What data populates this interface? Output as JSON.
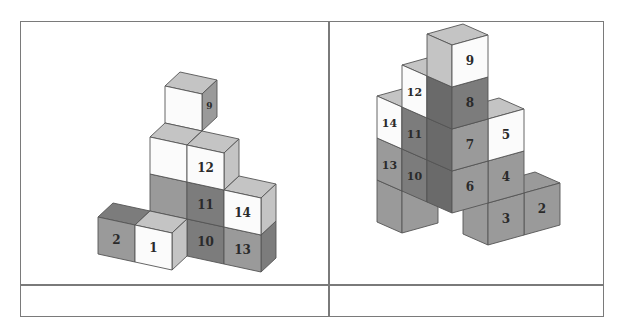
{
  "layout": {
    "columns": 2,
    "rows": 2,
    "cells": [
      {
        "id": "top-left",
        "content": "figure-left"
      },
      {
        "id": "top-right",
        "content": "figure-right"
      },
      {
        "id": "bottom-left",
        "content": ""
      },
      {
        "id": "bottom-right",
        "content": ""
      }
    ]
  },
  "colors": {
    "white": "#fbfbfb",
    "light": "#c4c4c4",
    "mid": "#9a9a9a",
    "dark": "#7c7c7c",
    "darker": "#6a6a6a",
    "edge": "#555555",
    "border": "#7a7a7a"
  },
  "figures": [
    {
      "name": "left-cube-stack",
      "origin": [
        135,
        262
      ],
      "axisX": [
        37,
        8
      ],
      "axisY": [
        15,
        -14
      ],
      "axisZ": [
        0,
        -37
      ],
      "faces": [
        "front",
        "right",
        "top"
      ],
      "cubes": [
        {
          "x": 0,
          "y": 2,
          "z": 3,
          "front": "white",
          "right": "mid",
          "top": "light",
          "frontLabel": "",
          "rightLabel": "9"
        },
        {
          "x": 0,
          "y": 1,
          "z": 2,
          "front": "white",
          "right": "mid",
          "top": "light",
          "frontLabel": "",
          "rightLabel": "5"
        },
        {
          "x": 0,
          "y": 1,
          "z": 1,
          "front": "mid",
          "right": "dark",
          "top": "light",
          "frontLabel": "",
          "rightLabel": "4"
        },
        {
          "x": 1,
          "y": 1,
          "z": 2,
          "front": "white",
          "right": "light",
          "top": "light",
          "frontLabel": "12",
          "rightLabel": ""
        },
        {
          "x": 1,
          "y": 1,
          "z": 1,
          "front": "dark",
          "right": "dark",
          "top": "light",
          "frontLabel": "11",
          "rightLabel": ""
        },
        {
          "x": 1,
          "y": 1,
          "z": 0,
          "front": "dark",
          "right": "dark",
          "top": "dark",
          "frontLabel": "10",
          "rightLabel": ""
        },
        {
          "x": 0,
          "y": 1,
          "z": 0,
          "front": "dark",
          "right": "darker",
          "top": "dark",
          "frontLabel": "",
          "rightLabel": "3"
        },
        {
          "x": 2,
          "y": 1,
          "z": 1,
          "front": "white",
          "right": "light",
          "top": "light",
          "frontLabel": "14",
          "rightLabel": ""
        },
        {
          "x": 2,
          "y": 1,
          "z": 0,
          "front": "mid",
          "right": "dark",
          "top": "light",
          "frontLabel": "13",
          "rightLabel": ""
        },
        {
          "x": -1,
          "y": 0,
          "z": 0,
          "front": "mid",
          "right": "mid",
          "top": "dark",
          "frontLabel": "2",
          "rightLabel": ""
        },
        {
          "x": 0,
          "y": 0,
          "z": 0,
          "front": "white",
          "right": "light",
          "top": "light",
          "frontLabel": "1",
          "rightLabel": ""
        }
      ]
    },
    {
      "name": "right-cube-stack",
      "origin": [
        452,
        255
      ],
      "axisR": [
        36,
        -10
      ],
      "axisL": [
        -25,
        -11
      ],
      "axisZ": [
        0,
        -42
      ],
      "faces": [
        "left",
        "right",
        "top"
      ],
      "cubes": [
        {
          "r": 2,
          "l": 1,
          "z": 0,
          "left": "mid",
          "right": "mid",
          "top": "mid",
          "rightLabel": "2",
          "leftLabel": ""
        },
        {
          "r": 1,
          "l": 2,
          "z": 1,
          "left": "mid",
          "right": "mid",
          "top": "light",
          "rightLabel": "",
          "leftLabel": ""
        },
        {
          "r": 1,
          "l": 1,
          "z": 2,
          "left": "mid",
          "right": "white",
          "top": "light",
          "rightLabel": "5",
          "leftLabel": ""
        },
        {
          "r": 0,
          "l": 3,
          "z": 2,
          "left": "white",
          "right": "mid",
          "top": "light",
          "rightLabel": "",
          "leftLabel": "14"
        },
        {
          "r": 0,
          "l": 3,
          "z": 1,
          "left": "mid",
          "right": "mid",
          "top": "light",
          "rightLabel": "",
          "leftLabel": "13"
        },
        {
          "r": 0,
          "l": 3,
          "z": 0,
          "left": "mid",
          "right": "mid",
          "top": "mid",
          "rightLabel": "",
          "leftLabel": ""
        },
        {
          "r": 0,
          "l": 2,
          "z": 3,
          "left": "white",
          "right": "mid",
          "top": "light",
          "rightLabel": "",
          "leftLabel": "12"
        },
        {
          "r": 0,
          "l": 2,
          "z": 2,
          "left": "dark",
          "right": "mid",
          "top": "light",
          "rightLabel": "",
          "leftLabel": "11"
        },
        {
          "r": 0,
          "l": 2,
          "z": 1,
          "left": "dark",
          "right": "mid",
          "top": "mid",
          "rightLabel": "",
          "leftLabel": "10"
        },
        {
          "r": 1,
          "l": 1,
          "z": 1,
          "left": "mid",
          "right": "mid",
          "top": "mid",
          "rightLabel": "4",
          "leftLabel": ""
        },
        {
          "r": 1,
          "l": 1,
          "z": 0,
          "left": "mid",
          "right": "mid",
          "top": "mid",
          "rightLabel": "3",
          "leftLabel": ""
        },
        {
          "r": 0,
          "l": 1,
          "z": 4,
          "left": "light",
          "right": "white",
          "top": "light",
          "rightLabel": "9",
          "leftLabel": ""
        },
        {
          "r": 0,
          "l": 1,
          "z": 3,
          "left": "darker",
          "right": "dark",
          "top": "mid",
          "rightLabel": "8",
          "leftLabel": ""
        },
        {
          "r": 0,
          "l": 1,
          "z": 2,
          "left": "darker",
          "right": "mid",
          "top": "mid",
          "rightLabel": "7",
          "leftLabel": ""
        },
        {
          "r": 0,
          "l": 1,
          "z": 1,
          "left": "darker",
          "right": "mid",
          "top": "mid",
          "rightLabel": "6",
          "leftLabel": ""
        }
      ]
    }
  ]
}
